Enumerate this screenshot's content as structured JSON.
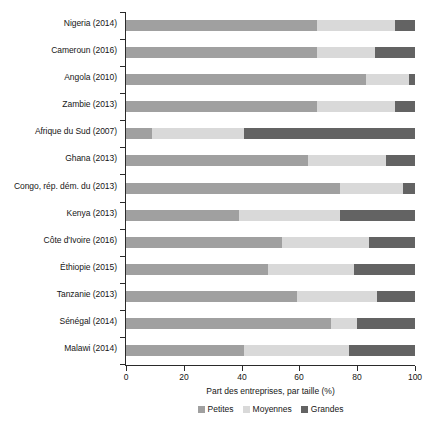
{
  "chart_data": {
    "type": "bar",
    "orientation": "horizontal",
    "stacked": true,
    "stack_mode": "percent",
    "title": "",
    "xlabel": "Part des entreprises, par taille (%)",
    "ylabel": "",
    "xlim": [
      0,
      100
    ],
    "xticks": [
      0,
      20,
      40,
      60,
      80,
      100
    ],
    "xtick_labels": [
      "0",
      "20",
      "40",
      "60",
      "80",
      "100"
    ],
    "grid": false,
    "legend_position": "bottom",
    "categories": [
      "Nigeria (2014)",
      "Cameroun (2016)",
      "Angola (2010)",
      "Zambie (2013)",
      "Afrique du Sud (2007)",
      "Ghana (2013)",
      "Congo, rép. dém. du (2013)",
      "Kenya (2013)",
      "Côte d'Ivoire (2016)",
      "Éthiopie (2015)",
      "Tanzanie (2013)",
      "Sénégal (2014)",
      "Malawi (2014)"
    ],
    "series": [
      {
        "name": "Petites",
        "color": "#a0a0a0",
        "values": [
          66,
          66,
          83,
          66,
          9,
          63,
          74,
          39,
          54,
          49,
          59,
          71,
          41
        ]
      },
      {
        "name": "Moyennes",
        "color": "#d9d9d9",
        "values": [
          27,
          20,
          15,
          27,
          32,
          27,
          22,
          35,
          30,
          30,
          28,
          9,
          36
        ]
      },
      {
        "name": "Grandes",
        "color": "#636363",
        "values": [
          7,
          14,
          2,
          7,
          59,
          10,
          4,
          26,
          16,
          21,
          13,
          20,
          23
        ]
      }
    ],
    "legend_entries": [
      "Petites",
      "Moyennes",
      "Grandes"
    ]
  },
  "colors": {
    "small": "#a0a0a0",
    "medium": "#d9d9d9",
    "large": "#636363",
    "axis": "#2a2a2a",
    "text": "#161616",
    "background": "#ffffff"
  }
}
